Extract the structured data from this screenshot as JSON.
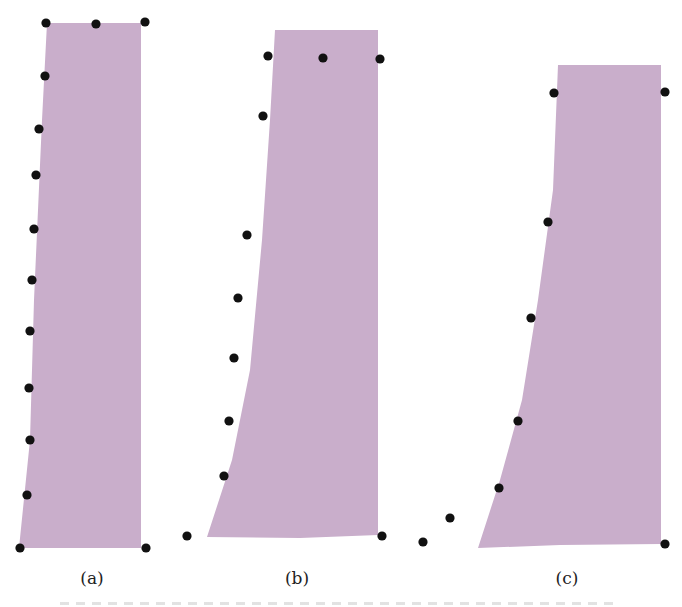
{
  "figure": {
    "fill_color": "#c9aecb",
    "dot_color": "#111111",
    "panels": [
      {
        "label": "(a)",
        "label_x": 92,
        "shape_points": "47,23 141,23 141,548 19,548 30,440 34,300 42,120",
        "dots": [
          [
            46,
            23
          ],
          [
            96,
            24
          ],
          [
            145,
            22
          ],
          [
            45,
            76
          ],
          [
            39,
            129
          ],
          [
            36,
            175
          ],
          [
            34,
            229
          ],
          [
            32,
            280
          ],
          [
            30,
            331
          ],
          [
            29,
            388
          ],
          [
            30,
            440
          ],
          [
            27,
            495
          ],
          [
            20,
            548
          ],
          [
            146,
            548
          ]
        ]
      },
      {
        "label": "(b)",
        "label_x": 297,
        "shape_points": "275,30 378,30 378,535 300,538 207,537 232,460 250,370 262,240 270,120",
        "dots": [
          [
            268,
            56
          ],
          [
            323,
            58
          ],
          [
            380,
            59
          ],
          [
            263,
            116
          ],
          [
            247,
            235
          ],
          [
            238,
            298
          ],
          [
            234,
            358
          ],
          [
            229,
            421
          ],
          [
            224,
            476
          ],
          [
            187,
            536
          ],
          [
            382,
            536
          ]
        ]
      },
      {
        "label": "(c)",
        "label_x": 567,
        "shape_points": "558,65 661,65 661,544 560,545 478,548 500,480 522,400 538,300 553,190",
        "dots": [
          [
            554,
            93
          ],
          [
            665,
            92
          ],
          [
            548,
            222
          ],
          [
            531,
            318
          ],
          [
            518,
            421
          ],
          [
            499,
            488
          ],
          [
            450,
            518
          ],
          [
            423,
            542
          ],
          [
            665,
            544
          ]
        ]
      }
    ]
  },
  "caption": {
    "text": "",
    "legible": false
  },
  "chart_data": {
    "type": "diagram",
    "title": "",
    "panels": [
      "(a)",
      "(b)",
      "(c)"
    ]
  }
}
